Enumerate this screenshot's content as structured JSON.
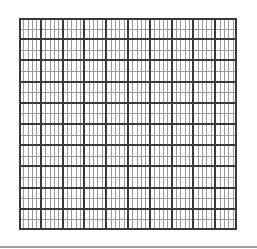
{
  "grid": {
    "major_columns": 10,
    "minor_per_column": 5,
    "major_rows": 10,
    "minor_per_row": 2,
    "width": 218,
    "height": 212,
    "colors": {
      "major": "#3a3a3a",
      "minor": "#9a9a9a",
      "background": "#ffffff"
    }
  },
  "footer": {
    "bar_color": "#a0a0a0"
  }
}
